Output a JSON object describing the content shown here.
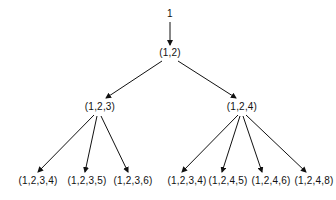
{
  "diagram": {
    "type": "tree",
    "root": {
      "id": "n0",
      "label": "1",
      "x": 170,
      "y": 14
    },
    "nodes": [
      {
        "id": "n1",
        "label": "(1,2)",
        "x": 170,
        "y": 53
      },
      {
        "id": "n2",
        "label": "(1,2,3)",
        "x": 100,
        "y": 107
      },
      {
        "id": "n3",
        "label": "(1,2,4)",
        "x": 242,
        "y": 107
      },
      {
        "id": "n4",
        "label": "(1,2,3,4)",
        "x": 38,
        "y": 181
      },
      {
        "id": "n5",
        "label": "(1,2,3,5)",
        "x": 87,
        "y": 181
      },
      {
        "id": "n6",
        "label": "(1,2,3,6)",
        "x": 133,
        "y": 181
      },
      {
        "id": "n7",
        "label": "(1,2,3,4)",
        "x": 187,
        "y": 181
      },
      {
        "id": "n8",
        "label": "(1,2,4,5)",
        "x": 228,
        "y": 181
      },
      {
        "id": "n9",
        "label": "(1,2,4,6)",
        "x": 271,
        "y": 181
      },
      {
        "id": "n10",
        "label": "(1,2,4,8)",
        "x": 314,
        "y": 181
      }
    ],
    "edges": [
      {
        "from": "n0",
        "to": "n1",
        "x1": 170,
        "y1": 22,
        "x2": 170,
        "y2": 45
      },
      {
        "from": "n1",
        "to": "n2",
        "x1": 162,
        "y1": 61,
        "x2": 106,
        "y2": 98
      },
      {
        "from": "n1",
        "to": "n3",
        "x1": 178,
        "y1": 61,
        "x2": 236,
        "y2": 98
      },
      {
        "from": "n2",
        "to": "n4",
        "x1": 94,
        "y1": 115,
        "x2": 38,
        "y2": 172
      },
      {
        "from": "n2",
        "to": "n5",
        "x1": 97,
        "y1": 116,
        "x2": 85,
        "y2": 172
      },
      {
        "from": "n2",
        "to": "n6",
        "x1": 101,
        "y1": 116,
        "x2": 128,
        "y2": 172
      },
      {
        "from": "n3",
        "to": "n7",
        "x1": 238,
        "y1": 115,
        "x2": 182,
        "y2": 172
      },
      {
        "from": "n3",
        "to": "n8",
        "x1": 240,
        "y1": 116,
        "x2": 222,
        "y2": 172
      },
      {
        "from": "n3",
        "to": "n9",
        "x1": 243,
        "y1": 116,
        "x2": 262,
        "y2": 172
      },
      {
        "from": "n3",
        "to": "n10",
        "x1": 246,
        "y1": 115,
        "x2": 306,
        "y2": 172
      }
    ],
    "colors": {
      "stroke": "#111111",
      "background": "#ffffff"
    }
  }
}
